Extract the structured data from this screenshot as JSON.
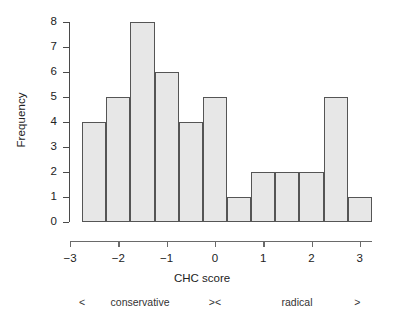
{
  "chart_data": {
    "type": "bar",
    "title": "",
    "subtitle": "",
    "xlabel": "CHC score",
    "ylabel": "Frequency",
    "xlim": [
      -3,
      3.25
    ],
    "ylim": [
      0,
      8
    ],
    "grid": false,
    "legend": null,
    "bin_width": 0.5,
    "bin_starts": [
      -2.75,
      -2.25,
      -1.75,
      -1.25,
      -0.75,
      -0.25,
      0.25,
      0.75,
      1.25,
      1.75,
      2.25,
      2.75
    ],
    "bin_ends": [
      -2.25,
      -1.75,
      -1.25,
      -0.75,
      -0.25,
      0.25,
      0.75,
      1.25,
      1.75,
      2.25,
      2.75,
      3.25
    ],
    "categories": [
      "-2.75 to -2.25",
      "-2.25 to -1.75",
      "-1.75 to -1.25",
      "-1.25 to -0.75",
      "-0.75 to -0.25",
      "-0.25 to 0.25",
      "0.25 to 0.75",
      "0.75 to 1.25",
      "1.25 to 1.75",
      "1.75 to 2.25",
      "2.25 to 2.75",
      "2.75 to 3.25"
    ],
    "values": [
      4,
      5,
      8,
      6,
      4,
      5,
      1,
      2,
      2,
      2,
      5,
      1
    ],
    "total_count": 45,
    "x_ticks": [
      -3,
      -2,
      -1,
      0,
      1,
      2,
      3
    ],
    "x_tick_labels": [
      "−3",
      "−2",
      "−1",
      "0",
      "1",
      "2",
      "3"
    ],
    "y_ticks": [
      0,
      1,
      2,
      3,
      4,
      5,
      6,
      7,
      8
    ],
    "y_tick_labels": [
      "0",
      "1",
      "2",
      "3",
      "4",
      "5",
      "6",
      "7",
      "8"
    ],
    "bar_fill_color": "#e7e7e7",
    "bar_edge_color": "#555555",
    "axis_color": "#4a4a4a",
    "background_color": "#ffffff"
  },
  "annotations": {
    "scale_items": [
      {
        "text": "<",
        "x_value": -2.75
      },
      {
        "text": "conservative",
        "x_value": -1.55
      },
      {
        "text": "><",
        "x_value": 0.0
      },
      {
        "text": "radical",
        "x_value": 1.7
      },
      {
        "text": ">",
        "x_value": 2.95
      }
    ]
  }
}
